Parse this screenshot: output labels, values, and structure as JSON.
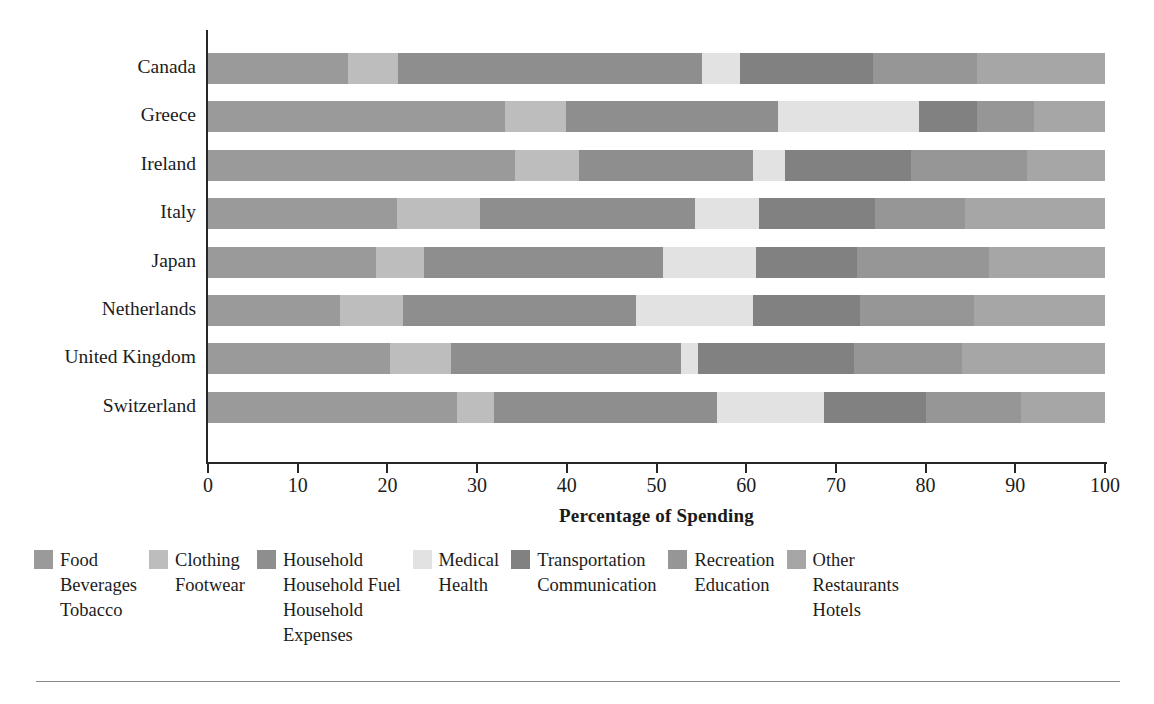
{
  "chart_data": {
    "type": "bar",
    "orientation": "horizontal",
    "stacked": true,
    "title": "",
    "xlabel": "Percentage of Spending",
    "ylabel": "",
    "xlim": [
      0,
      100
    ],
    "grid": false,
    "legend_position": "bottom",
    "xticks": [
      0,
      10,
      20,
      30,
      40,
      50,
      60,
      70,
      80,
      90,
      100
    ],
    "xtick_labels": [
      "0",
      "10",
      "20",
      "30",
      "40",
      "50",
      "60",
      "70",
      "80",
      "90",
      "100"
    ],
    "categories": [
      "Canada",
      "Greece",
      "Ireland",
      "Italy",
      "Japan",
      "Netherlands",
      "United Kingdom",
      "Switzerland"
    ],
    "series": [
      {
        "name": "Food Beverages Tobacco",
        "color": "#9a9a9a",
        "values": [
          15.6,
          33.1,
          34.2,
          21.1,
          18.7,
          14.7,
          20.3,
          27.8
        ]
      },
      {
        "name": "Clothing Footwear",
        "color": "#bdbdbd",
        "values": [
          5.6,
          6.8,
          7.2,
          9.2,
          5.4,
          7.0,
          6.8,
          4.1
        ]
      },
      {
        "name": "Household Household Fuel Household Expenses",
        "color": "#8e8e8e",
        "values": [
          33.9,
          23.6,
          19.4,
          24.0,
          26.6,
          26.0,
          25.6,
          24.8
        ]
      },
      {
        "name": "Medical Health",
        "color": "#e2e2e2",
        "values": [
          4.2,
          15.8,
          3.5,
          7.1,
          10.4,
          13.1,
          1.9,
          12.0
        ]
      },
      {
        "name": "Transportation Communication",
        "color": "#818181",
        "values": [
          14.8,
          6.4,
          14.1,
          13.0,
          11.3,
          11.9,
          17.4,
          11.3
        ]
      },
      {
        "name": "Recreation Education",
        "color": "#969696",
        "values": [
          11.6,
          6.4,
          12.9,
          10.0,
          14.7,
          12.7,
          12.1,
          10.6
        ]
      },
      {
        "name": "Other Restaurants Hotels",
        "color": "#a6a6a6",
        "values": [
          14.3,
          7.9,
          8.7,
          15.6,
          12.9,
          14.6,
          15.9,
          9.4
        ]
      }
    ]
  },
  "axis": {
    "x_title": "Percentage of Spending"
  },
  "legend": {
    "items": [
      {
        "swatch_color": "#9a9a9a",
        "lines": [
          "Food",
          "Beverages",
          "Tobacco"
        ]
      },
      {
        "swatch_color": "#bdbdbd",
        "lines": [
          "Clothing",
          "Footwear"
        ]
      },
      {
        "swatch_color": "#8e8e8e",
        "lines": [
          "Household",
          "Household Fuel",
          "Household",
          "Expenses"
        ]
      },
      {
        "swatch_color": "#e2e2e2",
        "lines": [
          "Medical",
          "Health"
        ]
      },
      {
        "swatch_color": "#818181",
        "lines": [
          "Transportation",
          "Communication"
        ]
      },
      {
        "swatch_color": "#969696",
        "lines": [
          "Recreation",
          "Education"
        ]
      },
      {
        "swatch_color": "#a6a6a6",
        "lines": [
          "Other",
          "Restaurants",
          "Hotels"
        ]
      }
    ]
  }
}
